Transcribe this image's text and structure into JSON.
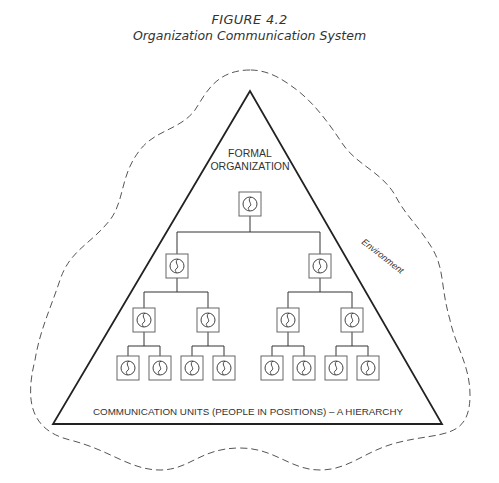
{
  "figure": {
    "number": "FIGURE 4.2",
    "title": "Organization Communication System"
  },
  "diagram": {
    "triangle_label_line1": "FORMAL",
    "triangle_label_line2": "ORGANIZATION",
    "environment_label": "Environment",
    "base_label": "COMMUNICATION UNITS (PEOPLE IN POSITIONS) – A HIERARCHY",
    "unit_icon": "person-in-position-icon",
    "hierarchy": {
      "levels": [
        {
          "level": 1,
          "count": 1
        },
        {
          "level": 2,
          "count": 2
        },
        {
          "level": 3,
          "count": 4
        },
        {
          "level": 4,
          "count": 8
        }
      ]
    },
    "colors": {
      "line": "#222222",
      "box": "#666666",
      "dashed_boundary": "#555555",
      "text": "#333333"
    }
  }
}
